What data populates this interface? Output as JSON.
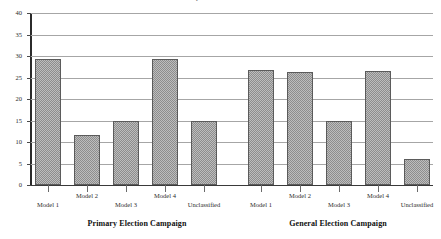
{
  "chart_data": {
    "type": "bar",
    "title": "Model Composition of Election Ads",
    "xlabel": "",
    "ylabel": "",
    "ylim": [
      0,
      40
    ],
    "ytick_labels": [
      "0",
      "5",
      "10",
      "15",
      "20",
      "25",
      "30",
      "35",
      "40"
    ],
    "ytick_values": [
      0,
      5,
      10,
      15,
      20,
      25,
      30,
      35,
      40
    ],
    "grid": true,
    "legend": "none",
    "categories": [
      "Model 1",
      "Model 2",
      "Model 3",
      "Model 4",
      "Unclassified"
    ],
    "groups": [
      {
        "name": "Primary Election Campaign",
        "categories": [
          "Model 1",
          "Model 2",
          "Model 3",
          "Model 4",
          "Unclassified"
        ],
        "values": [
          29.3,
          11.7,
          14.8,
          29.2,
          15.0
        ]
      },
      {
        "name": "General Election Campaign",
        "categories": [
          "Model 1",
          "Model 2",
          "Model 3",
          "Model 4",
          "Unclassified"
        ],
        "values": [
          26.7,
          26.3,
          15.0,
          26.5,
          6.0
        ]
      }
    ]
  },
  "axis": {
    "y_max": 40,
    "y_min": 0,
    "y_ticks": [
      "40",
      "35",
      "30",
      "25",
      "20",
      "15",
      "10",
      "5",
      "0"
    ]
  },
  "captions": {
    "left_group": "Primary Election Campaign",
    "right_group": "General Election Campaign"
  },
  "xlabels": {
    "primary": [
      "Model 1",
      "Model 2",
      "Model 3",
      "Model 4",
      "Unclassified"
    ],
    "general": [
      "Model 1",
      "Model 2",
      "Model 3",
      "Model 4",
      "Unclassified"
    ]
  },
  "colors": {
    "bar_fill": "#bdbdbd",
    "bar_pattern": "#8d8d8d",
    "bar_border": "#5b5b5b",
    "gridline": "#a6a6a6",
    "axis": "#2b2b2b",
    "text": "#1a1a1a"
  }
}
